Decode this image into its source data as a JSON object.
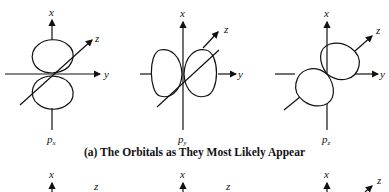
{
  "figure": {
    "caption_a": "(a) The Orbitals as They Most Likely Appear",
    "axes": {
      "x": "x",
      "y": "y",
      "z": "z"
    },
    "orbitals": [
      {
        "name": "p",
        "subscript": "x"
      },
      {
        "name": "p",
        "subscript": "y"
      },
      {
        "name": "p",
        "subscript": "z"
      }
    ],
    "row_b_axis_labels": [
      "x",
      "z",
      "x",
      "z",
      "x",
      "z"
    ]
  }
}
